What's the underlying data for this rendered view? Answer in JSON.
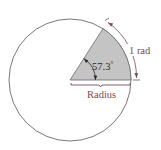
{
  "diagram": {
    "type": "radian-definition",
    "labels": {
      "angle": "57.3",
      "angle_unit": "°",
      "arc": "1 rad",
      "radius": "Radius"
    },
    "colors": {
      "sector_fill": "#c4c4c4",
      "circle_stroke": "#6a6a6a",
      "arc_annotation": "#7a4a55",
      "label_text": "#7a4a55",
      "angle_text": "#2a2a2a"
    }
  }
}
